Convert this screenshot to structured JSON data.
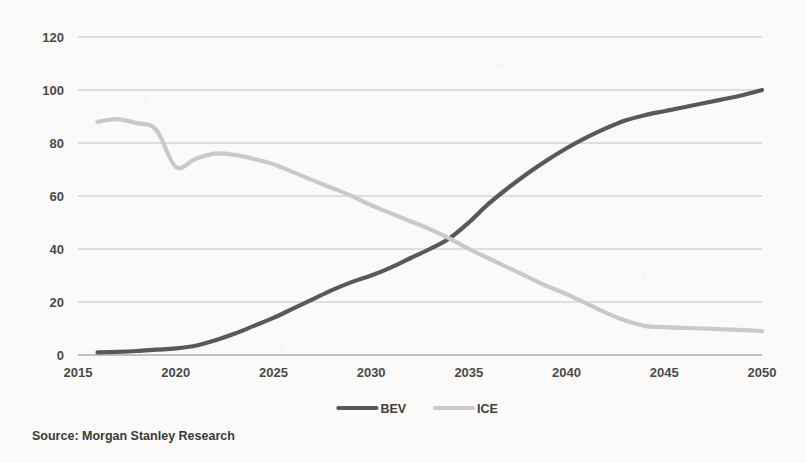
{
  "chart_data": {
    "type": "line",
    "title": "",
    "subtitle": "",
    "xlabel": "",
    "ylabel": "",
    "xlim": [
      2015,
      2050
    ],
    "ylim": [
      0,
      120
    ],
    "grid": true,
    "legend_position": "bottom-center",
    "y_ticks": [
      "0",
      "20",
      "40",
      "60",
      "80",
      "100",
      "120"
    ],
    "y_tick_values": [
      0,
      20,
      40,
      60,
      80,
      100,
      120
    ],
    "x_ticks": [
      "2015",
      "2020",
      "2025",
      "2030",
      "2035",
      "2040",
      "2045",
      "2050"
    ],
    "x_tick_values": [
      2015,
      2020,
      2025,
      2030,
      2035,
      2040,
      2045,
      2050
    ],
    "x": [
      2016,
      2017,
      2018,
      2019,
      2020,
      2021,
      2022,
      2023,
      2024,
      2025,
      2026,
      2027,
      2028,
      2029,
      2030,
      2031,
      2032,
      2033,
      2034,
      2035,
      2036,
      2037,
      2038,
      2039,
      2040,
      2041,
      2042,
      2043,
      2044,
      2045,
      2046,
      2047,
      2048,
      2049,
      2050
    ],
    "series": [
      {
        "name": "BEV",
        "color": "#595959",
        "values": [
          1,
          1.2,
          1.5,
          2,
          2.5,
          3.5,
          5.5,
          8,
          11,
          14,
          17.5,
          21,
          24.5,
          27.5,
          30,
          33,
          36.5,
          40,
          44,
          50,
          57,
          63,
          68.5,
          73.5,
          78,
          82,
          85.5,
          88.5,
          90.5,
          92,
          93.5,
          95,
          96.5,
          98,
          100
        ]
      },
      {
        "name": "ICE",
        "color": "#c9c9c9",
        "values": [
          88,
          89,
          87.5,
          85,
          71,
          74,
          76,
          75.5,
          74,
          72,
          69,
          66,
          63,
          60,
          56.5,
          53.5,
          50.5,
          47.5,
          44,
          40,
          36.5,
          33,
          29.5,
          26,
          23,
          19.5,
          16,
          13,
          11,
          10.5,
          10.2,
          10,
          9.7,
          9.4,
          9
        ]
      }
    ],
    "annotations": [],
    "crossover": {
      "year": 2034,
      "value": 44
    }
  },
  "legend": {
    "items": [
      {
        "label": "BEV",
        "color": "#595959"
      },
      {
        "label": "ICE",
        "color": "#c9c9c9"
      }
    ]
  },
  "footer": {
    "source": "Source: Morgan Stanley Research"
  },
  "colors": {
    "background": "#fbfaf8",
    "gridline": "#bdbdbd",
    "axis": "#8a8a8a",
    "bev": "#595959",
    "ice": "#c9c9c9",
    "text": "#3a3a3a"
  }
}
